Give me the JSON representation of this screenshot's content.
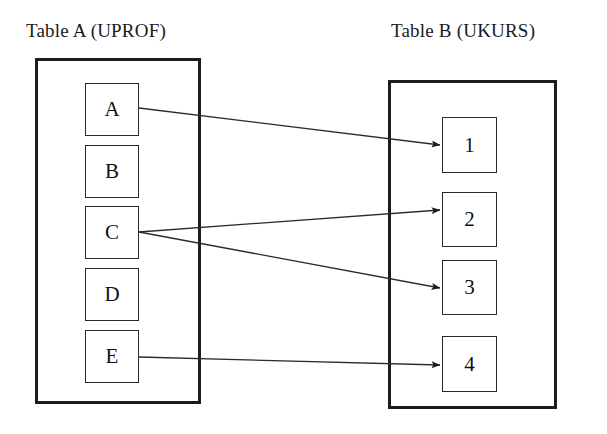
{
  "diagram": {
    "type": "entity-mapping-diagram",
    "background_color": "#ffffff",
    "line_color": "#1c1c1c",
    "tables": [
      {
        "id": "table-a",
        "title": "Table A (UPROF)",
        "box": {
          "x": 35,
          "y": 58,
          "w": 166,
          "h": 346
        },
        "items": [
          {
            "id": "a",
            "label": "A",
            "x": 85,
            "y": 83,
            "w": 54,
            "h": 53
          },
          {
            "id": "b",
            "label": "B",
            "x": 85,
            "y": 145,
            "w": 54,
            "h": 53
          },
          {
            "id": "c",
            "label": "C",
            "x": 85,
            "y": 206,
            "w": 54,
            "h": 53
          },
          {
            "id": "d",
            "label": "D",
            "x": 85,
            "y": 268,
            "w": 54,
            "h": 53
          },
          {
            "id": "e",
            "label": "E",
            "x": 85,
            "y": 330,
            "w": 54,
            "h": 53
          }
        ]
      },
      {
        "id": "table-b",
        "title": "Table B (UKURS)",
        "box": {
          "x": 388,
          "y": 80,
          "w": 169,
          "h": 329
        },
        "items": [
          {
            "id": "one",
            "label": "1",
            "x": 442,
            "y": 117,
            "w": 55,
            "h": 56
          },
          {
            "id": "two",
            "label": "2",
            "x": 442,
            "y": 192,
            "w": 55,
            "h": 55
          },
          {
            "id": "three",
            "label": "3",
            "x": 442,
            "y": 260,
            "w": 55,
            "h": 55
          },
          {
            "id": "four",
            "label": "4",
            "x": 442,
            "y": 336,
            "w": 55,
            "h": 56
          }
        ]
      }
    ],
    "connections": [
      {
        "id": "a-to-1",
        "from": "A",
        "to": "1",
        "x1": 139,
        "y1": 108,
        "x2": 440,
        "y2": 145
      },
      {
        "id": "c-to-2",
        "from": "C",
        "to": "2",
        "x1": 139,
        "y1": 232,
        "x2": 440,
        "y2": 210
      },
      {
        "id": "c-to-3",
        "from": "C",
        "to": "3",
        "x1": 139,
        "y1": 232,
        "x2": 440,
        "y2": 288
      },
      {
        "id": "e-to-4",
        "from": "E",
        "to": "4",
        "x1": 139,
        "y1": 357,
        "x2": 440,
        "y2": 365
      }
    ]
  }
}
